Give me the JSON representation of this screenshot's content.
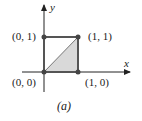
{
  "figure": {
    "caption": "(a)",
    "axes": {
      "x_label": "x",
      "y_label": "y"
    },
    "points": [
      {
        "label": "(0, 0)",
        "x": 0,
        "y": 0
      },
      {
        "label": "(1, 0)",
        "x": 1,
        "y": 0
      },
      {
        "label": "(1, 1)",
        "x": 1,
        "y": 1
      },
      {
        "label": "(0, 1)",
        "x": 0,
        "y": 1
      }
    ],
    "shaded_region": "triangle with vertices (0,0), (1,0), (1,1)",
    "colors": {
      "line": "#555555",
      "fill": "#d9d9d9",
      "axis": "#222222"
    }
  }
}
